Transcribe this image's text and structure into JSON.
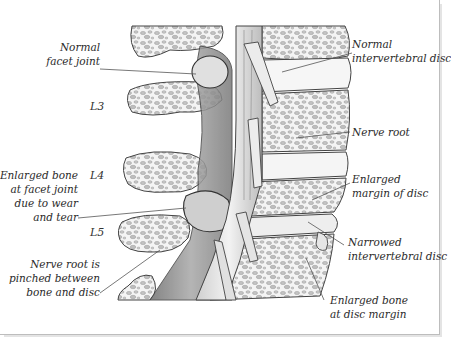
{
  "figure": {
    "vertebra_labels": [
      "L3",
      "L4",
      "L5"
    ],
    "left_labels": [
      {
        "id": "normal-facet-joint",
        "lines": [
          "Normal",
          "facet joint"
        ]
      },
      {
        "id": "enlarged-bone-facet",
        "lines": [
          "Enlarged bone",
          "at facet joint",
          "due to wear",
          "and tear"
        ]
      },
      {
        "id": "nerve-root-pinched",
        "lines": [
          "Nerve root is",
          "pinched between",
          "bone and disc"
        ]
      }
    ],
    "right_labels": [
      {
        "id": "normal-disc",
        "lines": [
          "Normal",
          "intervertebral disc"
        ]
      },
      {
        "id": "nerve-root",
        "lines": [
          "Nerve root"
        ]
      },
      {
        "id": "enlarged-margin",
        "lines": [
          "Enlarged",
          "margin of disc"
        ]
      },
      {
        "id": "narrowed-disc",
        "lines": [
          "Narrowed",
          "intervertebral disc"
        ]
      },
      {
        "id": "enlarged-bone-disc-margin",
        "lines": [
          "Enlarged bone",
          "at disc margin"
        ]
      }
    ],
    "colors": {
      "line": "#555555",
      "bone_fill": "#f2f2f2",
      "bone_spot": "#b8b8b8",
      "shade": "#9a9a9a",
      "text": "#2a2a2a"
    }
  }
}
